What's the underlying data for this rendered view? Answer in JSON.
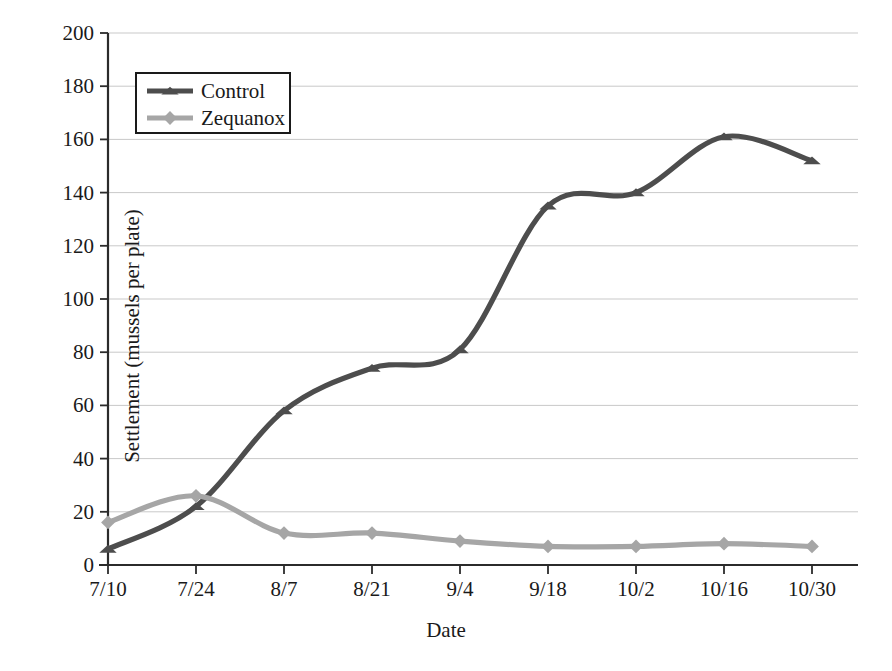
{
  "chart_data": {
    "type": "line",
    "title": "",
    "xlabel": "Date",
    "ylabel": "Settlement (mussels per plate)",
    "categories": [
      "7/10",
      "7/24",
      "8/7",
      "8/21",
      "9/4",
      "9/18",
      "10/2",
      "10/16",
      "10/30"
    ],
    "x_tick_labels": [
      "7/10",
      "7/24",
      "8/7",
      "8/21",
      "9/4",
      "9/18",
      "10/2",
      "10/16",
      "10/30"
    ],
    "y_tick_labels": [
      "0",
      "20",
      "40",
      "60",
      "80",
      "100",
      "120",
      "140",
      "160",
      "180",
      "200"
    ],
    "y_tick_values": [
      0,
      20,
      40,
      60,
      80,
      100,
      120,
      140,
      160,
      180,
      200
    ],
    "ylim": [
      0,
      200
    ],
    "grid": true,
    "grid_axis": "y",
    "legend_position": "upper-left",
    "series": [
      {
        "name": "Control",
        "color": "#4d4d4d",
        "marker": "triangle",
        "values": [
          6,
          22,
          58,
          74,
          81,
          135,
          140,
          161,
          152
        ]
      },
      {
        "name": "Zequanox",
        "color": "#a6a6a6",
        "marker": "diamond",
        "values": [
          16,
          26,
          12,
          12,
          9,
          7,
          7,
          8,
          7
        ]
      }
    ]
  },
  "legend": {
    "entries": [
      {
        "label": "Control"
      },
      {
        "label": "Zequanox"
      }
    ]
  },
  "axis_titles": {
    "x": "Date",
    "y": "Settlement (mussels per plate)"
  },
  "colors": {
    "control": "#4d4d4d",
    "zequanox": "#a6a6a6",
    "axis": "#2b2b2b",
    "grid": "#c9c9c9",
    "text": "#1a1a1a",
    "background": "#ffffff"
  }
}
